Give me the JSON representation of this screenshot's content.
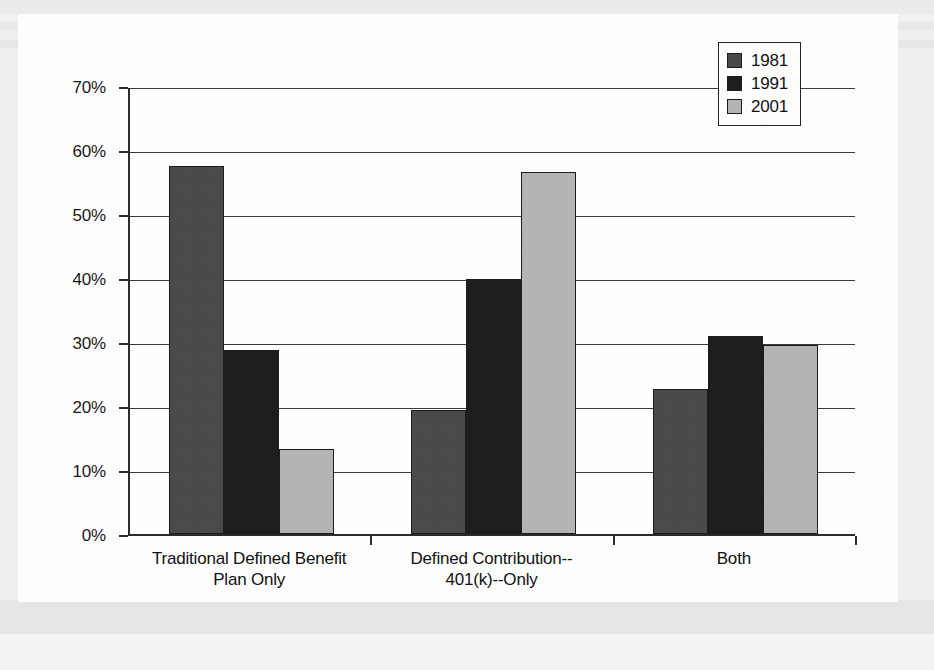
{
  "chart_data": {
    "type": "bar",
    "title": "",
    "subtitle": "",
    "xlabel": "",
    "ylabel": "",
    "categories": [
      "Traditional Defined Benefit Plan Only",
      "Defined Contribution--401(k)--Only",
      "Both"
    ],
    "category_lines": [
      [
        "Traditional Defined Benefit",
        "Plan Only"
      ],
      [
        "Defined Contribution--",
        "401(k)--Only"
      ],
      [
        "Both"
      ]
    ],
    "series": [
      {
        "name": "1981",
        "color": "#4a4a4a",
        "values": [
          57.5,
          19.3,
          22.7
        ]
      },
      {
        "name": "1991",
        "color": "#1e1e1e",
        "values": [
          28.8,
          39.8,
          31.0
        ]
      },
      {
        "name": "2001",
        "color": "#b5b5b5",
        "values": [
          13.3,
          56.5,
          29.5
        ]
      }
    ],
    "ylim": [
      0,
      70
    ],
    "ytick_values": [
      0,
      10,
      20,
      30,
      40,
      50,
      60,
      70
    ],
    "ytick_labels": [
      "0%",
      "10%",
      "20%",
      "30%",
      "40%",
      "50%",
      "60%",
      "70%"
    ],
    "grid": true,
    "grid_axis": "y",
    "legend_position": "top-right",
    "value_labels": false
  },
  "legend": {
    "entries": [
      {
        "label": "1981",
        "color": "#4a4a4a",
        "swatch": "legend-swatch-1981"
      },
      {
        "label": "1991",
        "color": "#1e1e1e",
        "swatch": "legend-swatch-1991"
      },
      {
        "label": "2001",
        "color": "#b5b5b5",
        "swatch": "legend-swatch-2001"
      }
    ]
  },
  "colors": {
    "series_1981": "#4a4a4a",
    "series_1991": "#1e1e1e",
    "series_2001": "#b5b5b5",
    "axis": "#2b2b2b",
    "gridline": "#3a3a3a",
    "paper": "#ffffff",
    "scan_background": "#ececed",
    "text": "#111111"
  }
}
